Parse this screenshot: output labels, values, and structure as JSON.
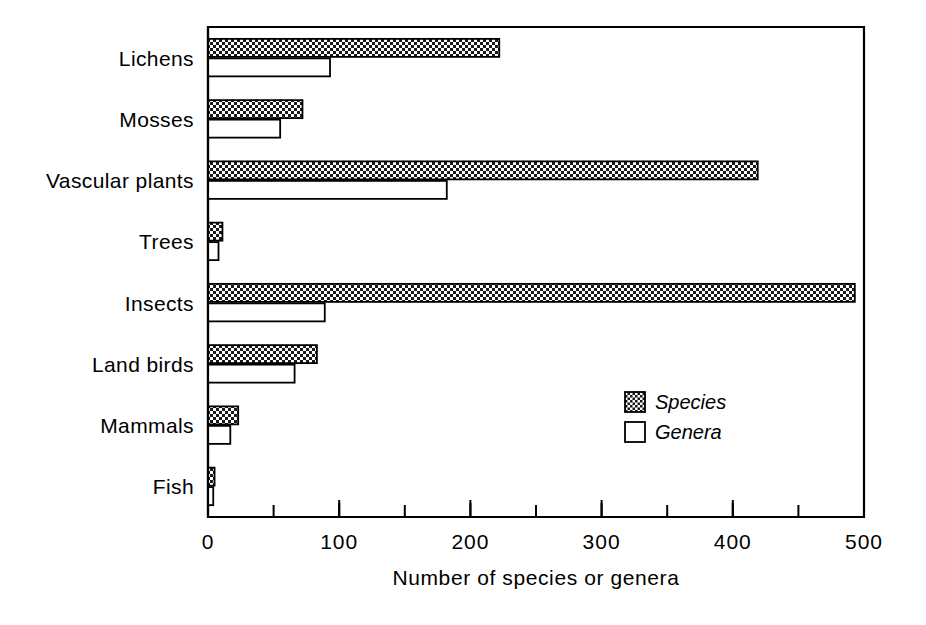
{
  "chart_data": {
    "type": "bar",
    "orientation": "horizontal",
    "title": "",
    "xlabel": "Number of species or genera",
    "ylabel": "",
    "xlim": [
      0,
      500
    ],
    "xticks": [
      0,
      100,
      200,
      300,
      400,
      500
    ],
    "xtick_labels": [
      "0",
      "100",
      "200",
      "300",
      "400",
      "500"
    ],
    "minor_tick_step": 50,
    "grid": false,
    "legend_position": "inside-right-lower",
    "categories": [
      "Lichens",
      "Mosses",
      "Vascular plants",
      "Trees",
      "Insects",
      "Land birds",
      "Mammals",
      "Fish"
    ],
    "series": [
      {
        "name": "Species",
        "fill": "dotted-hatch",
        "color": "#d9d9d9",
        "values": [
          222,
          72,
          419,
          11,
          493,
          83,
          23,
          5
        ]
      },
      {
        "name": "Genera",
        "fill": "white",
        "color": "#ffffff",
        "values": [
          93,
          55,
          182,
          8,
          89,
          66,
          17,
          4
        ]
      }
    ]
  },
  "legend": {
    "items": [
      {
        "label": "Species",
        "swatch": "dotted-hatch"
      },
      {
        "label": "Genera",
        "swatch": "white"
      }
    ]
  },
  "colors": {
    "ink": "#000000",
    "paper": "#ffffff",
    "species_fill": "#d9d9d9",
    "genera_fill": "#ffffff"
  }
}
